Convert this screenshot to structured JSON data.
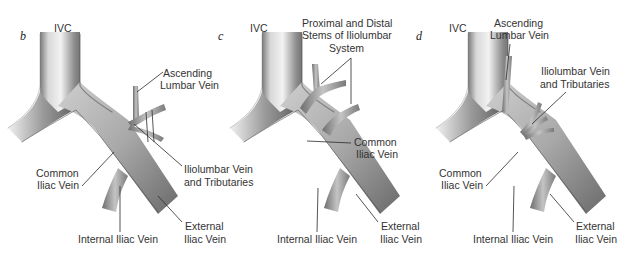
{
  "figure": {
    "panels": [
      {
        "letter": "b",
        "labels": {
          "ivc": "IVC",
          "ascending_lumbar_1": "Ascending",
          "ascending_lumbar_2": "Lumbar Vein",
          "common_iliac_1": "Common",
          "common_iliac_2": "Iliac Vein",
          "iliolumbar_1": "Iliolumbar Vein",
          "iliolumbar_2": "and Tributaries",
          "internal_iliac": "Internal Iliac Vein",
          "external_iliac_1": "External",
          "external_iliac_2": "Iliac Vein"
        }
      },
      {
        "letter": "c",
        "labels": {
          "ivc": "IVC",
          "stems_1": "Proximal and Distal",
          "stems_2": "Stems of Iliolumbar",
          "stems_3": "System",
          "common_iliac_1": "Common",
          "common_iliac_2": "Iliac Vein",
          "internal_iliac": "Internal Iliac Vein",
          "external_iliac_1": "External",
          "external_iliac_2": "Iliac Vein"
        }
      },
      {
        "letter": "d",
        "labels": {
          "ivc": "IVC",
          "ascending_lumbar_1": "Ascending",
          "ascending_lumbar_2": "Lumbar Vein",
          "iliolumbar_1": "Iliolumbar Vein",
          "iliolumbar_2": "and Tributaries",
          "common_iliac_1": "Common",
          "common_iliac_2": "Iliac Vein",
          "internal_iliac": "Internal Iliac Vein",
          "external_iliac_1": "External",
          "external_iliac_2": "Iliac Vein"
        }
      }
    ],
    "colors": {
      "background": "#ffffff",
      "vein_light": "#e6e6e6",
      "vein_mid": "#9a9a9a",
      "vein_dark": "#4a4a4a",
      "text": "#333333"
    }
  }
}
